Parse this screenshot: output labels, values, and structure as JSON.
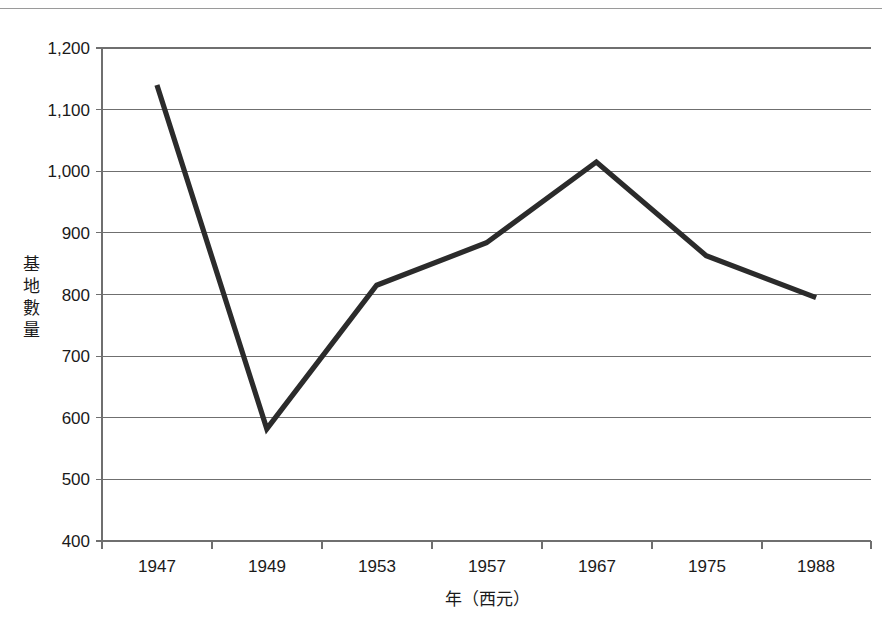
{
  "chart_data": {
    "type": "line",
    "title": "",
    "subtitle": "",
    "xlabel": "年（西元）",
    "ylabel": "基地數量",
    "ylabel_chars": [
      "基",
      "地",
      "數",
      "量"
    ],
    "categories": [
      "1947",
      "1949",
      "1953",
      "1957",
      "1967",
      "1975",
      "1988"
    ],
    "values": [
      1140,
      582,
      815,
      884,
      1015,
      863,
      795
    ],
    "series": [
      {
        "name": "基地數量",
        "values": [
          1140,
          582,
          815,
          884,
          1015,
          863,
          795
        ]
      }
    ],
    "ylim": [
      400,
      1200
    ],
    "ytick_values": [
      400,
      500,
      600,
      700,
      800,
      900,
      1000,
      1100,
      1200
    ],
    "ytick_labels": [
      "400",
      "500",
      "600",
      "700",
      "800",
      "900",
      "1,000",
      "1,100",
      "1,200"
    ],
    "grid": "horizontal",
    "legend": "none",
    "annotations": [],
    "colors": {
      "series_line": "#2b2b2b",
      "gridline": "#6f6f6f",
      "axis": "#6f6f6f",
      "text": "#1a1a1a",
      "background": "#ffffff"
    }
  }
}
